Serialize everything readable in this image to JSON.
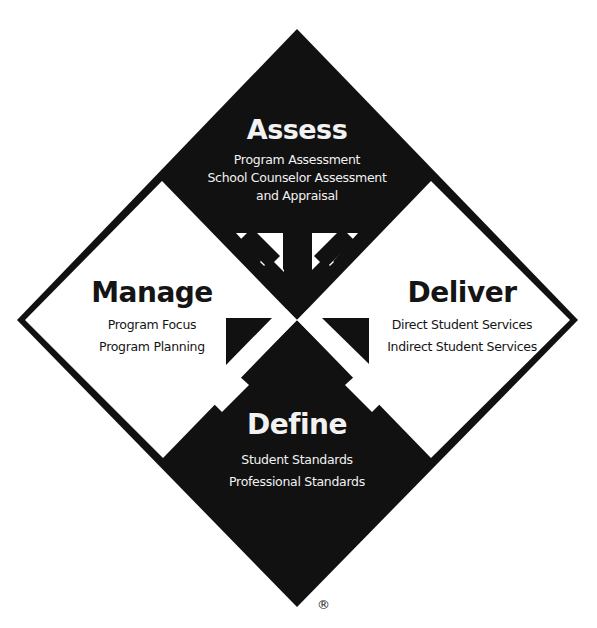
{
  "diagram": {
    "colors": {
      "dark": "#111111",
      "light": "#ffffff"
    },
    "sections": {
      "assess": {
        "title": "Assess",
        "items": [
          "Program Assessment",
          "School Counselor Assessment",
          "and Appraisal"
        ]
      },
      "manage": {
        "title": "Manage",
        "items": [
          "Program Focus",
          "Program Planning"
        ]
      },
      "deliver": {
        "title": "Deliver",
        "items": [
          "Direct Student Services",
          "Indirect Student Services"
        ]
      },
      "define": {
        "title": "Define",
        "items": [
          "Student Standards",
          "Professional Standards"
        ]
      }
    },
    "arrows": [
      {
        "name": "arrow-up-left",
        "direction": "up-left",
        "color": "light"
      },
      {
        "name": "arrow-up-right",
        "direction": "up-right",
        "color": "light"
      },
      {
        "name": "arrow-down-into-center",
        "direction": "down",
        "color": "dark"
      },
      {
        "name": "arrow-to-manage",
        "direction": "up-left",
        "color": "dark"
      },
      {
        "name": "arrow-to-deliver",
        "direction": "up-right",
        "color": "dark"
      }
    ],
    "trademark": "®"
  }
}
